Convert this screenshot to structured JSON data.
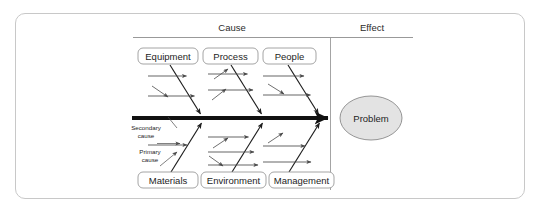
{
  "diagram": {
    "type": "fishbone-ishikawa",
    "headers": {
      "cause": "Cause",
      "effect": "Effect"
    },
    "categories_top": [
      {
        "label": "Equipment"
      },
      {
        "label": "Process"
      },
      {
        "label": "People"
      }
    ],
    "categories_bottom": [
      {
        "label": "Materials"
      },
      {
        "label": "Environment"
      },
      {
        "label": "Management"
      }
    ],
    "effect_node": {
      "label": "Problem",
      "fill_color": "#e3e3e3",
      "border_color": "#8a8a8a"
    },
    "annotations": [
      {
        "line1": "Secondary",
        "line2": "cause"
      },
      {
        "line1": "Primary",
        "line2": "cause"
      }
    ],
    "colors": {
      "frame_border": "#c8c8c8",
      "spine": "#111111",
      "bone": "#1d1d1d",
      "subbone": "#4a4a4a",
      "rule": "#8d8d8d",
      "text": "#1d1d1d",
      "background": "#ffffff"
    }
  }
}
